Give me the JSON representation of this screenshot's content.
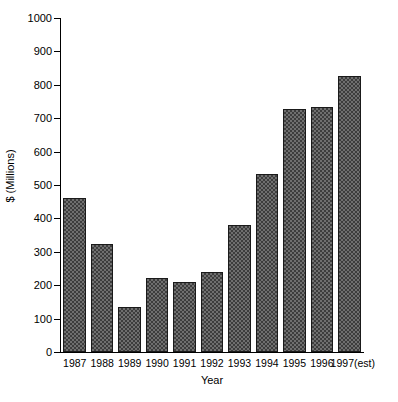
{
  "chart_data": {
    "type": "bar",
    "title": "",
    "xlabel": "Year",
    "ylabel": "$ (Millions)",
    "categories": [
      "1987",
      "1988",
      "1989",
      "1990",
      "1991",
      "1992",
      "1993",
      "1994",
      "1995",
      "1996",
      "1997(est)"
    ],
    "values": [
      461,
      322,
      135,
      221,
      210,
      240,
      380,
      532,
      729,
      735,
      827
    ],
    "ylim": [
      0,
      1000
    ],
    "yticks": [
      0,
      100,
      200,
      300,
      400,
      500,
      600,
      700,
      800,
      900,
      1000
    ],
    "ytick_labels": [
      "0",
      "100",
      "200",
      "300",
      "400",
      "500",
      "600",
      "700",
      "800",
      "900",
      "1000"
    ],
    "grid": false,
    "legend": null,
    "bar_fill": "#6f6f6f",
    "bar_pattern_color": "#3d3d3d",
    "bar_edge_color": "#1a1a1a",
    "axis_color": "#000000",
    "background": "#ffffff"
  },
  "axes": {
    "y_title": "$ (Millions)",
    "x_title": "Year"
  }
}
